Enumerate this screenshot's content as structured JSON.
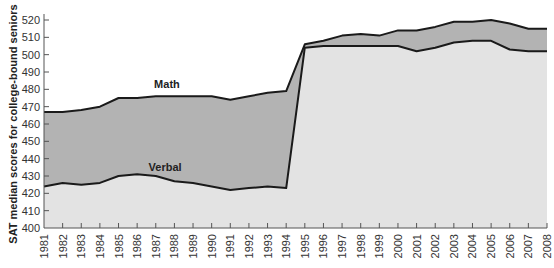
{
  "chart_data": {
    "type": "area",
    "title": "",
    "xlabel": "",
    "ylabel": "SAT median scores for college-bound seniors",
    "ylim": [
      400,
      520
    ],
    "yticks": [
      400,
      410,
      420,
      430,
      440,
      450,
      460,
      470,
      480,
      490,
      500,
      510,
      520
    ],
    "grid": false,
    "legend": "inline labels",
    "x": [
      1981,
      1982,
      1983,
      1984,
      1985,
      1986,
      1987,
      1988,
      1989,
      1990,
      1991,
      1992,
      1993,
      1994,
      1995,
      1996,
      1997,
      1998,
      1999,
      2000,
      2001,
      2002,
      2003,
      2004,
      2005,
      2006,
      2007,
      2008
    ],
    "series": [
      {
        "name": "Math",
        "color": "#b3b3b3",
        "values": [
          467,
          467,
          468,
          470,
          475,
          475,
          476,
          476,
          476,
          476,
          474,
          476,
          478,
          479,
          506,
          508,
          511,
          512,
          511,
          514,
          514,
          516,
          519,
          519,
          520,
          518,
          515,
          515
        ]
      },
      {
        "name": "Verbal",
        "color": "#e3e3e3",
        "values": [
          424,
          426,
          425,
          426,
          430,
          431,
          430,
          427,
          426,
          424,
          422,
          423,
          424,
          423,
          504,
          505,
          505,
          505,
          505,
          505,
          502,
          504,
          507,
          508,
          508,
          503,
          502,
          502
        ]
      }
    ],
    "annotations": [
      {
        "text": "Math",
        "year": 1987.6,
        "value": 481
      },
      {
        "text": "Verbal",
        "year": 1987.5,
        "value": 433
      }
    ]
  },
  "colors": {
    "math_fill": "#b3b3b3",
    "verbal_fill": "#e3e3e3",
    "line": "#1a1a1a",
    "axis": "#555555"
  }
}
